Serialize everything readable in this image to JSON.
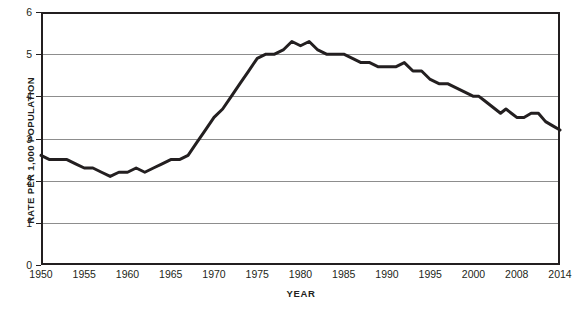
{
  "chart_data": {
    "type": "line",
    "title": "",
    "xlabel": "YEAR",
    "ylabel": "RATE PER 1,000 POPULATION",
    "ylim": [
      0,
      6
    ],
    "yticks": [
      0,
      1,
      2,
      3,
      4,
      5,
      6
    ],
    "ytick_labels": [
      "0",
      "1",
      "2",
      "3",
      "4",
      "5",
      "6"
    ],
    "xtick_labels": [
      "1950",
      "1955",
      "1960",
      "1965",
      "1970",
      "1975",
      "1980",
      "1985",
      "1990",
      "1995",
      "2000",
      "2008",
      "2014"
    ],
    "grid": "horizontal",
    "legend": "none",
    "line_color": "#231f20",
    "line_width": 3,
    "x": [
      1950,
      1951,
      1952,
      1953,
      1954,
      1955,
      1956,
      1957,
      1958,
      1959,
      1960,
      1961,
      1962,
      1963,
      1964,
      1965,
      1966,
      1967,
      1968,
      1969,
      1970,
      1971,
      1972,
      1973,
      1974,
      1975,
      1976,
      1977,
      1978,
      1979,
      1980,
      1981,
      1982,
      1983,
      1984,
      1985,
      1986,
      1987,
      1988,
      1989,
      1990,
      1991,
      1992,
      1993,
      1994,
      1995,
      1996,
      1997,
      1998,
      1999,
      2000,
      2001,
      2002,
      2003,
      2004,
      2005,
      2006,
      2007,
      2008,
      2009,
      2010,
      2011,
      2012,
      2013,
      2014
    ],
    "values": [
      2.6,
      2.5,
      2.5,
      2.5,
      2.4,
      2.3,
      2.3,
      2.2,
      2.1,
      2.2,
      2.2,
      2.3,
      2.2,
      2.3,
      2.4,
      2.5,
      2.5,
      2.6,
      2.9,
      3.2,
      3.5,
      3.7,
      4.0,
      4.3,
      4.6,
      4.9,
      5.0,
      5.0,
      5.1,
      5.3,
      5.2,
      5.3,
      5.1,
      5.0,
      5.0,
      5.0,
      4.9,
      4.8,
      4.8,
      4.7,
      4.7,
      4.7,
      4.8,
      4.6,
      4.6,
      4.4,
      4.3,
      4.3,
      4.2,
      4.1,
      4.0,
      4.0,
      3.9,
      3.8,
      3.7,
      3.6,
      3.7,
      3.6,
      3.5,
      3.5,
      3.6,
      3.6,
      3.4,
      3.3,
      3.2
    ]
  },
  "axes": {
    "y_title": "RATE PER 1,000 POPULATION",
    "x_title": "YEAR"
  }
}
